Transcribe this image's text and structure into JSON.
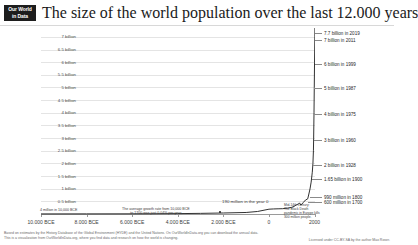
{
  "brand": {
    "logo_line1": "Our World",
    "logo_line2": "in Data"
  },
  "header": {
    "title": "The size of the world population over the last 12.000 years"
  },
  "chart_data": {
    "type": "line",
    "title": "The size of the world population over the last 12.000 years",
    "xlabel": "",
    "ylabel": "",
    "xlim": [
      -10000,
      2019
    ],
    "ylim": [
      0,
      7700000000
    ],
    "grid": true,
    "legend": "none",
    "x_tick_labels": [
      "10.000 BCE",
      "8.000 BCE",
      "6.000 BCE",
      "4.000 BCE",
      "2.000 BCE",
      "0",
      "2000"
    ],
    "x_tick_values": [
      -10000,
      -8000,
      -6000,
      -4000,
      -2000,
      0,
      2000
    ],
    "y_tick_labels": [
      "7 billion",
      "6.5 billion",
      "6 billion",
      "5.5 billion",
      "5 billion",
      "4.5 billion",
      "4 billion",
      "3.5 billion",
      "3 billion",
      "2.5 billion",
      "2 billion",
      "1.5 billion",
      "1 billion",
      "0.5 billion"
    ],
    "y_tick_values": [
      7.0,
      6.5,
      6.0,
      5.5,
      5.0,
      4.5,
      4.0,
      3.5,
      3.0,
      2.5,
      2.0,
      1.5,
      1.0,
      0.5
    ],
    "y_unit": "billion",
    "x": [
      -10000,
      -8000,
      -6000,
      -5000,
      -4000,
      -3000,
      -2000,
      -1000,
      -500,
      0,
      200,
      400,
      600,
      800,
      1000,
      1100,
      1200,
      1300,
      1340,
      1400,
      1500,
      1600,
      1700,
      1750,
      1800,
      1850,
      1900,
      1928,
      1950,
      1960,
      1975,
      1987,
      1999,
      2011,
      2019
    ],
    "y": [
      4000000,
      5000000,
      7000000,
      10000000,
      15000000,
      25000000,
      40000000,
      60000000,
      100000000,
      190000000,
      200000000,
      205000000,
      210000000,
      230000000,
      265000000,
      300000000,
      360000000,
      400000000,
      440000000,
      350000000,
      450000000,
      550000000,
      600000000,
      790000000,
      990000000,
      1260000000,
      1650000000,
      2000000000,
      2500000000,
      3000000000,
      4000000000,
      5000000000,
      6000000000,
      7000000000,
      7700000000
    ],
    "milestones": [
      {
        "label": "7.7 billion in 2019",
        "year": 2019,
        "value": 7700000000
      },
      {
        "label": "7 billion in 2011",
        "year": 2011,
        "value": 7000000000
      },
      {
        "label": "6 billion in 1999",
        "year": 1999,
        "value": 6000000000
      },
      {
        "label": "5 billion in 1987",
        "year": 1987,
        "value": 5000000000
      },
      {
        "label": "4 billion in 1975",
        "year": 1975,
        "value": 4000000000
      },
      {
        "label": "3 billion in 1960",
        "year": 1960,
        "value": 3000000000
      },
      {
        "label": "2 billion in 1928",
        "year": 1928,
        "value": 2000000000
      },
      {
        "label": "1.65 billion in 1900",
        "year": 1900,
        "value": 1650000000
      },
      {
        "label": "990 million in 1800",
        "year": 1800,
        "value": 990000000
      },
      {
        "label": "600 million in 1700",
        "year": 1700,
        "value": 600000000
      }
    ],
    "annotations": [
      {
        "name": "start-value",
        "text": "4 million in 10,000 BCE"
      },
      {
        "name": "growth-rate",
        "line1": "The average growth rate from 10,000 BCE",
        "line2": "to 1700 was just 0.04% per year"
      },
      {
        "name": "year-zero",
        "text": "190 million in the year 0"
      },
      {
        "name": "black-death",
        "line1": "Mid-14th century:",
        "line2": "The Black Death",
        "line3": "pandemic in Europe kills",
        "line4": "300 million people."
      }
    ]
  },
  "footer": {
    "line1": "Based on estimates by the History Database of the Global Environment (HYDE) and the United Nations. On OurWorldInData.org you can download the annual data.",
    "line2": "This is a visualization from OurWorldInData.org, where you find data and research on how the world is changing.",
    "license": "Licensed under CC-BY-SA by the author Max Roser."
  }
}
